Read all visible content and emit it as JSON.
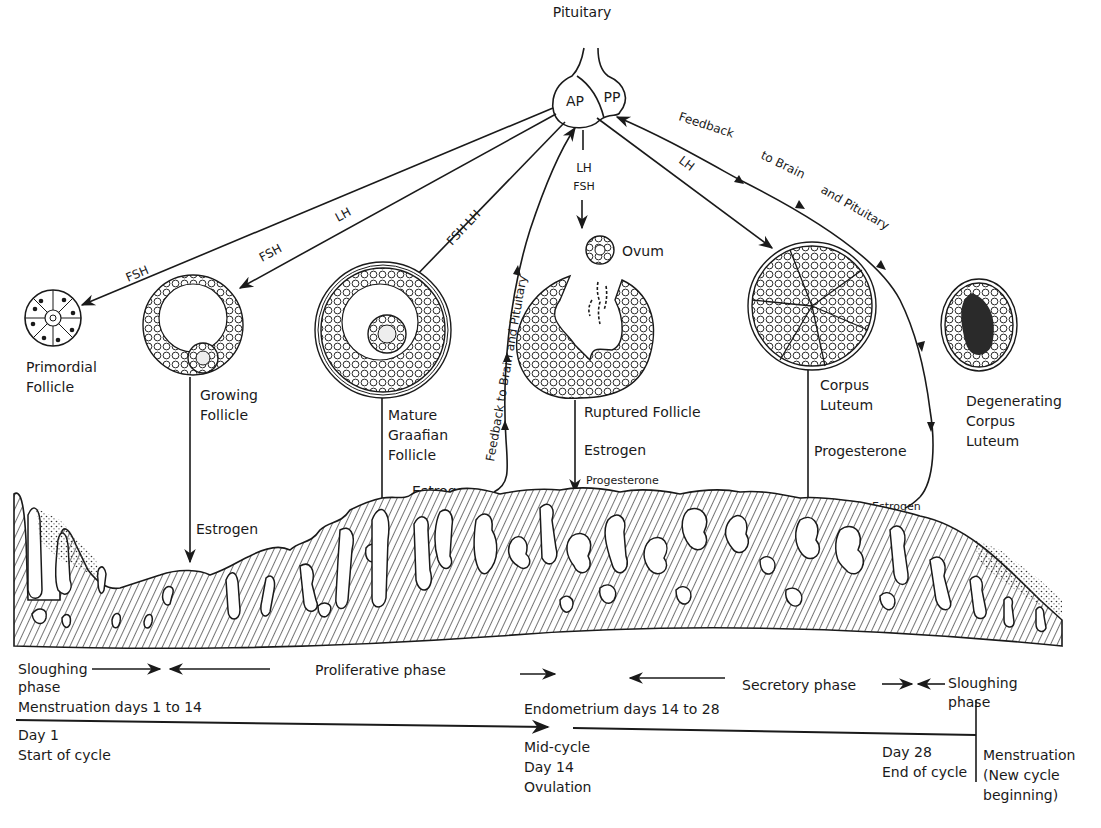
{
  "figure": {
    "pituitary": {
      "label": "Pituitary",
      "anterior": "AP",
      "posterior": "PP"
    },
    "hormone_arrows": {
      "to_primordial": "FSH",
      "to_growing_fsh": "FSH",
      "to_growing_lh": "LH",
      "to_mature": "FSH LH",
      "to_ovum_lh": "LH",
      "to_ovum_fsh": "FSH",
      "to_corpus_luteum": "LH"
    },
    "feedback": {
      "left": "Feedback to Brain and Pituitary",
      "right_1": "Feedback",
      "right_2": "to Brain",
      "right_3": "and Pituitary"
    },
    "structures": {
      "primordial": [
        "Primordial",
        "Follicle"
      ],
      "growing": [
        "Growing",
        "Follicle"
      ],
      "mature": [
        "Mature",
        "Graafian",
        "Follicle"
      ],
      "ovum": "Ovum",
      "ruptured": "Ruptured Follicle",
      "corpus_luteum": [
        "Corpus",
        "Luteum"
      ],
      "degenerating": [
        "Degenerating",
        "Corpus",
        "Luteum"
      ]
    },
    "secretions": {
      "growing_estrogen": "Estrogen",
      "mature_estrogen": "Estrogen",
      "ruptured_estrogen": "Estrogen",
      "ruptured_progesterone": "Progesterone",
      "corpus_progesterone": "Progesterone",
      "degenerating_estrogen": "Estrogen"
    },
    "phases": {
      "sloughing_left": [
        "Sloughing",
        "phase"
      ],
      "proliferative": "Proliferative phase",
      "secretory": "Secretory phase",
      "sloughing_right": [
        "Sloughing",
        "phase"
      ]
    },
    "timeline": {
      "menstruation_range": "Menstruation days 1 to 14",
      "endometrium_range": "Endometrium days 14 to 28",
      "start": [
        "Day 1",
        "Start of cycle"
      ],
      "mid": [
        "Mid-cycle",
        "Day 14",
        "Ovulation"
      ],
      "end": [
        "Day 28",
        "End of cycle"
      ],
      "new_cycle": [
        "Menstruation",
        "(New cycle",
        "beginning)"
      ]
    }
  }
}
